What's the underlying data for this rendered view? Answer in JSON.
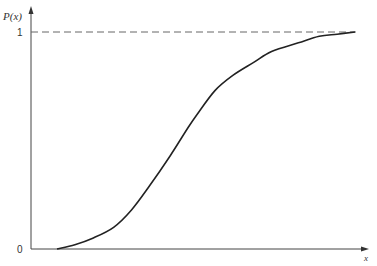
{
  "chart_data": {
    "type": "line",
    "title": "",
    "xlabel": "x",
    "ylabel": "P(x)",
    "ylim": [
      0,
      1
    ],
    "xlim": [
      0,
      1
    ],
    "y_ticks": [
      {
        "value": 0,
        "label": "0"
      },
      {
        "value": 1,
        "label": "1"
      }
    ],
    "reference_lines": [
      {
        "orientation": "horizontal",
        "value": 1,
        "style": "dashed"
      }
    ],
    "series": [
      {
        "name": "P(x)",
        "description": "S-shaped cumulative distribution curve rising from 0 to 1",
        "x": [
          0.0,
          0.06,
          0.12,
          0.19,
          0.25,
          0.31,
          0.38,
          0.44,
          0.47,
          0.53,
          0.59,
          0.66,
          0.72,
          0.81,
          0.88,
          0.94,
          1.0
        ],
        "y": [
          0.0,
          0.02,
          0.05,
          0.1,
          0.18,
          0.29,
          0.43,
          0.56,
          0.62,
          0.73,
          0.8,
          0.86,
          0.91,
          0.95,
          0.98,
          0.99,
          1.0
        ]
      }
    ],
    "grid": false,
    "legend": "none"
  },
  "caption": ""
}
